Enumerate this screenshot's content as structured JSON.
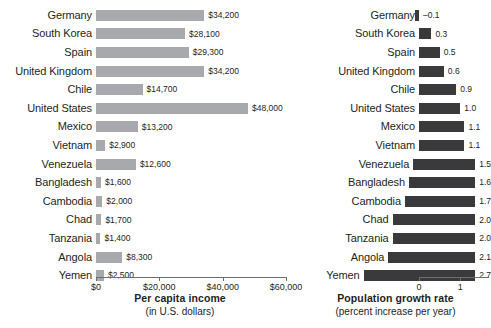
{
  "chart_data": [
    {
      "type": "bar",
      "orientation": "horizontal",
      "title": "Per capita income",
      "subtitle": "(in U.S. dollars)",
      "xlabel": "Per capita income (in U.S. dollars)",
      "ylabel": "",
      "xlim": [
        0,
        60000
      ],
      "xticks": [
        0,
        20000,
        40000,
        60000
      ],
      "xtick_labels": [
        "$0",
        "$20,000",
        "$40,000",
        "$60,000"
      ],
      "grid": false,
      "legend": false,
      "bar_color": "#a7a9ac",
      "categories": [
        "Germany",
        "South Korea",
        "Spain",
        "United Kingdom",
        "Chile",
        "United States",
        "Mexico",
        "Vietnam",
        "Venezuela",
        "Bangladesh",
        "Cambodia",
        "Chad",
        "Tanzania",
        "Angola",
        "Yemen"
      ],
      "values": [
        34200,
        28100,
        29300,
        34200,
        14700,
        48000,
        13200,
        2900,
        12600,
        1600,
        2000,
        1700,
        1400,
        8300,
        2500
      ],
      "value_labels": [
        "$34,200",
        "$28,100",
        "$29,300",
        "$34,200",
        "$14,700",
        "$48,000",
        "$13,200",
        "$2,900",
        "$12,600",
        "$1,600",
        "$2,000",
        "$1,700",
        "$1,400",
        "$8,300",
        "$2,500"
      ]
    },
    {
      "type": "bar",
      "orientation": "horizontal",
      "title": "Population growth rate",
      "subtitle": "(percent increase per year)",
      "xlabel": "Population growth rate (percent increase per year)",
      "ylabel": "",
      "xlim": [
        0,
        3
      ],
      "xticks": [
        0,
        1,
        2,
        3
      ],
      "xtick_labels": [
        "0",
        "1",
        "2",
        "3"
      ],
      "grid": false,
      "legend": false,
      "bar_color": "#3a3a3c",
      "categories": [
        "Germany",
        "South Korea",
        "Spain",
        "United Kingdom",
        "Chile",
        "United States",
        "Mexico",
        "Vietnam",
        "Venezuela",
        "Bangladesh",
        "Cambodia",
        "Chad",
        "Tanzania",
        "Angola",
        "Yemen"
      ],
      "values": [
        -0.1,
        0.3,
        0.5,
        0.6,
        0.9,
        1.0,
        1.1,
        1.1,
        1.5,
        1.6,
        1.7,
        2.0,
        2.0,
        2.1,
        2.7
      ],
      "value_labels": [
        "–0.1",
        "0.3",
        "0.5",
        "0.6",
        "0.9",
        "1.0",
        "1.1",
        "1.1",
        "1.5",
        "1.6",
        "1.7",
        "2.0",
        "2.0",
        "2.1",
        "2.7"
      ]
    }
  ],
  "left_panel": {
    "axis_title": "Per capita income",
    "axis_subtitle": "(in U.S. dollars)"
  },
  "right_panel": {
    "axis_title": "Population growth rate",
    "axis_subtitle": "(percent increase per year)"
  }
}
